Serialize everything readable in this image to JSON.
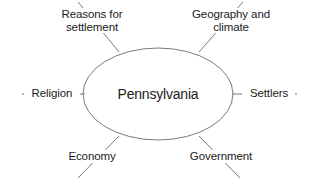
{
  "diagram": {
    "type": "concept-web",
    "center": {
      "label": "Pennsylvania",
      "shape": "ellipse"
    },
    "nodes": [
      {
        "id": "reasons",
        "label": "Reasons for\nsettlement",
        "position": "top-left"
      },
      {
        "id": "geography",
        "label": "Geography and\nclimate",
        "position": "top-right"
      },
      {
        "id": "religion",
        "label": "Religion",
        "position": "left"
      },
      {
        "id": "settlers",
        "label": "Settlers",
        "position": "right"
      },
      {
        "id": "economy",
        "label": "Economy",
        "position": "bottom-left"
      },
      {
        "id": "government",
        "label": "Government",
        "position": "bottom-right"
      }
    ],
    "colors": {
      "background": "#ffffff",
      "stroke": "#7a7a7a",
      "text": "#1b1b1b"
    }
  }
}
